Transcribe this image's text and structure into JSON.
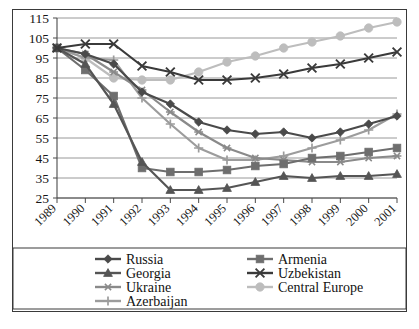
{
  "chart_data": {
    "type": "line",
    "title": "",
    "subtitle": "",
    "xlabel": "",
    "ylabel": "",
    "x": [
      "1989",
      "1990",
      "1991",
      "1992",
      "1993",
      "1994",
      "1995",
      "1996",
      "1997",
      "1998",
      "1999",
      "2000",
      "2001"
    ],
    "categories": [
      "1989",
      "1990",
      "1991",
      "1992",
      "1993",
      "1994",
      "1995",
      "1996",
      "1997",
      "1998",
      "1999",
      "2000",
      "2001"
    ],
    "ylim": [
      25,
      115
    ],
    "yticks": [
      25,
      35,
      45,
      55,
      65,
      75,
      85,
      95,
      105,
      115
    ],
    "ytick_labels": [
      "25",
      "35",
      "45",
      "55",
      "65",
      "75",
      "85",
      "95",
      "105",
      "115"
    ],
    "grid": true,
    "grid_axis": "y",
    "legend_position": "bottom",
    "xtick_rotation": -45,
    "series": [
      {
        "name": "Russia",
        "marker": "diamond",
        "color": "#4a4a4a",
        "values": [
          100,
          97,
          92,
          78,
          72,
          63,
          59,
          57,
          58,
          55,
          58,
          62,
          66
        ]
      },
      {
        "name": "Georgia",
        "marker": "triangle",
        "color": "#555555",
        "values": [
          100,
          92,
          72,
          43,
          29,
          29,
          30,
          33,
          36,
          35,
          36,
          36,
          37
        ]
      },
      {
        "name": "Ukraine",
        "marker": "asterisk",
        "color": "#8a8a8a",
        "values": [
          100,
          97,
          88,
          79,
          68,
          58,
          50,
          45,
          44,
          43,
          43,
          45,
          46
        ]
      },
      {
        "name": "Azerbaijan",
        "marker": "plus",
        "color": "#9c9c9c",
        "values": [
          100,
          95,
          94,
          75,
          62,
          50,
          44,
          44,
          46,
          50,
          54,
          59,
          67
        ]
      },
      {
        "name": "Armenia",
        "marker": "square",
        "color": "#6e6e6e",
        "values": [
          100,
          89,
          76,
          40,
          38,
          38,
          39,
          41,
          42,
          45,
          46,
          48,
          50
        ]
      },
      {
        "name": "Uzbekistan",
        "marker": "cross",
        "color": "#3a3a3a",
        "values": [
          100,
          102,
          102,
          91,
          88,
          84,
          84,
          85,
          87,
          90,
          92,
          95,
          98
        ]
      },
      {
        "name": "Central Europe",
        "marker": "circle",
        "color": "#bdbdbd",
        "values": [
          100,
          95,
          85,
          84,
          84,
          88,
          93,
          96,
          100,
          103,
          106,
          110,
          113
        ]
      }
    ]
  },
  "legend": {
    "items": [
      {
        "label": "Russia",
        "marker": "diamond",
        "color": "#4a4a4a"
      },
      {
        "label": "Armenia",
        "marker": "square",
        "color": "#6e6e6e"
      },
      {
        "label": "Georgia",
        "marker": "triangle",
        "color": "#555555"
      },
      {
        "label": "Uzbekistan",
        "marker": "cross",
        "color": "#3a3a3a"
      },
      {
        "label": "Ukraine",
        "marker": "asterisk",
        "color": "#8a8a8a"
      },
      {
        "label": "Central Europe",
        "marker": "circle",
        "color": "#bdbdbd"
      },
      {
        "label": "Azerbaijan",
        "marker": "plus",
        "color": "#9c9c9c"
      }
    ]
  },
  "colors": {
    "frame": "#3a3a3a",
    "grid": "#8c8c8c",
    "background": "#ffffff",
    "text": "#161616"
  }
}
